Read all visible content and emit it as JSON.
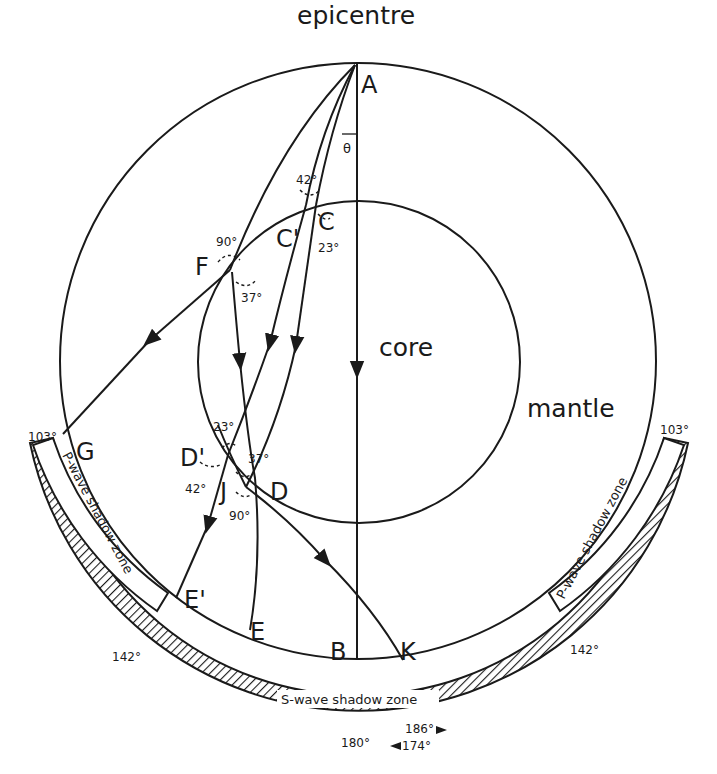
{
  "diagram": {
    "title": "epicentre",
    "regions": {
      "core": "core",
      "mantle": "mantle"
    },
    "points": {
      "A": "A",
      "B": "B",
      "C": "C",
      "C_prime": "C'",
      "D": "D",
      "D_prime": "D'",
      "E": "E",
      "E_prime": "E'",
      "F": "F",
      "G": "G",
      "J": "J",
      "K": "K"
    },
    "angle_symbol": "θ",
    "angles": {
      "at_C_incident": "42°",
      "at_C_refracted": "23°",
      "at_F_incident": "90°",
      "at_F_refracted": "37°",
      "at_D_prime_inner": "23°",
      "at_D_prime_outer": "42°",
      "at_D_inner": "37°",
      "at_D_outer": "90°"
    },
    "zones": {
      "p_wave_left": "P-wave shadow zone",
      "p_wave_right": "P-wave shadow zone",
      "s_wave": "S-wave shadow zone"
    },
    "degree_marks": {
      "left_103": "103°",
      "right_103": "103°",
      "left_142": "142°",
      "right_142": "142°",
      "bottom_180": "180°",
      "bottom_186": "186°",
      "bottom_174": "174°"
    },
    "colors": {
      "ink": "#1a1a1a",
      "paper": "#ffffff"
    }
  }
}
